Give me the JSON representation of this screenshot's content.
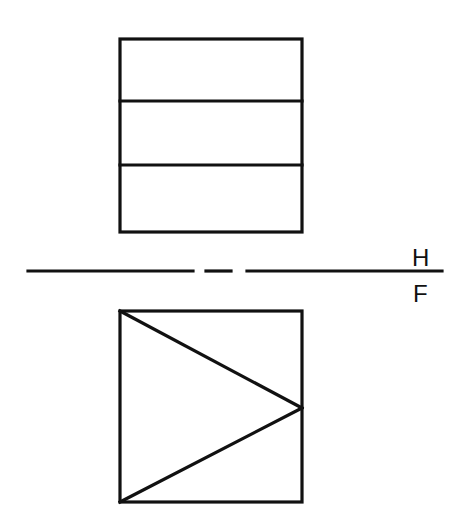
{
  "diagram": {
    "type": "orthographic-projection",
    "stroke_color": "#111111",
    "background": "#ffffff",
    "reference_line": {
      "label_above": "H",
      "label_below": "F",
      "style": "long-short-long (fold line)"
    },
    "top_view": {
      "name": "horizontal projection",
      "shape": "rectangle divided into three horizontal bands",
      "bands": 3
    },
    "front_view": {
      "name": "frontal projection",
      "shape": "square with triangle from left corners to right-edge midpoint"
    }
  }
}
